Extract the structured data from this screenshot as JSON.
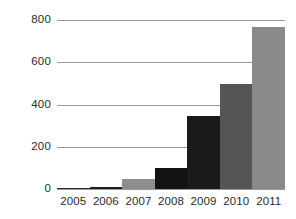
{
  "chart_data": {
    "type": "bar",
    "title": "",
    "subtitle": "",
    "xlabel": "",
    "ylabel": "",
    "categories": [
      "2005",
      "2006",
      "2007",
      "2008",
      "2009",
      "2010",
      "2011"
    ],
    "values": [
      3,
      10,
      48,
      100,
      345,
      495,
      765
    ],
    "series": [
      {
        "name": "",
        "values": [
          3,
          10,
          48,
          100,
          345,
          495,
          765
        ]
      }
    ],
    "bar_colors": [
      "#2f2f2f",
      "#1f1f1f",
      "#8d8d8d",
      "#121212",
      "#1a1a1a",
      "#555555",
      "#8a8a8a"
    ],
    "ylim": [
      0,
      800
    ],
    "yticks": [
      0,
      200,
      400,
      600,
      800
    ],
    "ytick_labels": [
      "0",
      "200",
      "400",
      "600",
      "800"
    ],
    "grid": true,
    "grid_color": "#9a9a9a",
    "legend": false,
    "legend_position": "none",
    "background_color": "#ffffff",
    "text_color": "#2b2b2b"
  }
}
